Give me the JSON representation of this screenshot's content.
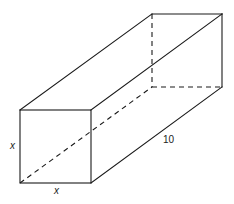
{
  "figure": {
    "type": "rectangular prism",
    "labels": {
      "front_height": "x",
      "front_width": "x",
      "length": "10"
    },
    "colors": {
      "stroke": "#1a1a1a",
      "background": "#ffffff"
    }
  }
}
